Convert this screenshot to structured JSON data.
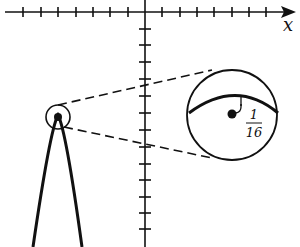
{
  "diagram": {
    "axis_x_label": "x",
    "magnified_label_numerator": "1",
    "magnified_label_denominator": "16",
    "colors": {
      "ink": "#111111",
      "background": "#ffffff"
    }
  }
}
